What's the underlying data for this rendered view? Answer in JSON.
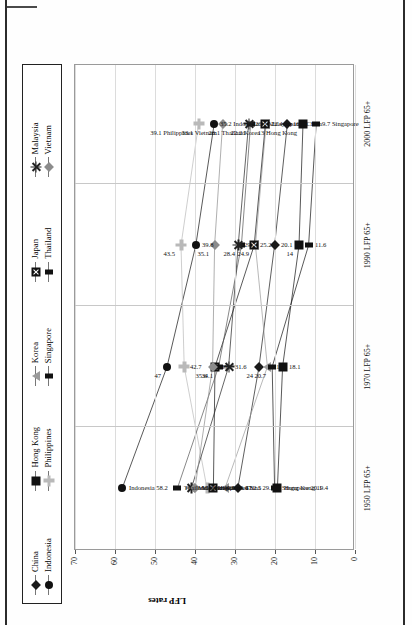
{
  "chart_data": {
    "type": "line",
    "title": "",
    "xlabel": "",
    "ylabel": "LFP rates",
    "ylim": [
      0,
      70
    ],
    "ytick_values": [
      0,
      10,
      20,
      30,
      40,
      50,
      60,
      70
    ],
    "categories": [
      "1950 LFP 65+",
      "1970 LFP 65+",
      "1990 LFP 65+",
      "2000 LFP 65+"
    ],
    "grid": true,
    "legend_position": "top",
    "series": [
      {
        "name": "China",
        "marker": "diamond",
        "color": "#1a1a1a",
        "values": [
          29.3,
          24.0,
          20.1,
          16.9
        ]
      },
      {
        "name": "Indonesia",
        "marker": "circle",
        "color": "#111111",
        "values": [
          58.2,
          47.0,
          39.8,
          35.2
        ]
      },
      {
        "name": "Hong Kong",
        "marker": "square",
        "color": "#111111",
        "values": [
          19.4,
          18.1,
          14.0,
          13.0
        ]
      },
      {
        "name": "Philippines",
        "marker": "plus-gray",
        "color": "#b9b9b9",
        "values": [
          37.0,
          42.7,
          43.5,
          39.1
        ]
      },
      {
        "name": "Korea",
        "marker": "tri",
        "color": "#9a9a9a",
        "values": [
          32.5,
          21.9,
          24.9,
          22.2
        ]
      },
      {
        "name": "Singapore",
        "marker": "square-sm",
        "color": "#111111",
        "values": [
          20.1,
          20.7,
          11.6,
          9.7
        ]
      },
      {
        "name": "Japan",
        "marker": "xbox",
        "color": "#111111",
        "values": [
          35.4,
          35.0,
          25.2,
          22.4
        ]
      },
      {
        "name": "Thailand",
        "marker": "square-sm",
        "color": "#555555",
        "values": [
          44.4,
          34.1,
          28.4,
          26.1
        ]
      },
      {
        "name": "Malaysia",
        "marker": "star",
        "color": "#222222",
        "values": [
          40.9,
          31.6,
          29.2,
          26.6
        ]
      },
      {
        "name": "Vietnam",
        "marker": "diamond-gray",
        "color": "#8c8c8c",
        "values": [
          40.0,
          35.6,
          35.1,
          33.1
        ]
      }
    ],
    "point_labels": {
      "1950 LFP 65+": [
        {
          "series": "Indonesia",
          "text": "Indonesia 58.2"
        },
        {
          "series": "Thailand",
          "text": "Thailand 44.4"
        },
        {
          "series": "Malaysia",
          "text": "Malaysia 40.9"
        },
        {
          "series": "Vietnam",
          "text": "Vietnam 40"
        },
        {
          "series": "Philippines",
          "text": "Philippines 37"
        },
        {
          "series": "Japan",
          "text": "Japan 35.4"
        },
        {
          "series": "Korea",
          "text": "Korea 32.5"
        },
        {
          "series": "China",
          "text": "China 29.3"
        },
        {
          "series": "Singapore",
          "text": "Singapore 20.1"
        },
        {
          "series": "Hong Kong",
          "text": "Hong Kong 19.4"
        }
      ],
      "1970 LFP 65+": [
        {
          "series": "Indonesia",
          "text": "47"
        },
        {
          "series": "Philippines",
          "text": "42.7"
        },
        {
          "series": "Vietnam",
          "text": "35.6"
        },
        {
          "series": "Japan",
          "text": "35"
        },
        {
          "series": "Thailand",
          "text": "34.1"
        },
        {
          "series": "Malaysia",
          "text": "31.6"
        },
        {
          "series": "China",
          "text": "24"
        },
        {
          "series": "Korea",
          "text": "21.9"
        },
        {
          "series": "Singapore",
          "text": "20.7"
        },
        {
          "series": "Hong Kong",
          "text": "18.1"
        }
      ],
      "1990 LFP 65+": [
        {
          "series": "Philippines",
          "text": "43.5"
        },
        {
          "series": "Indonesia",
          "text": "39.8"
        },
        {
          "series": "Vietnam",
          "text": "35.1"
        },
        {
          "series": "Malaysia",
          "text": "29.2"
        },
        {
          "series": "Thailand",
          "text": "28.4"
        },
        {
          "series": "Japan",
          "text": "25.2"
        },
        {
          "series": "Korea",
          "text": "24.9"
        },
        {
          "series": "China",
          "text": "20.1"
        },
        {
          "series": "Hong Kong",
          "text": "14"
        },
        {
          "series": "Singapore",
          "text": "11.6"
        }
      ],
      "2000 LFP 65+": [
        {
          "series": "Philippines",
          "text": "39.1 Philippines"
        },
        {
          "series": "Indonesia",
          "text": "35.2 Indonesia"
        },
        {
          "series": "Vietnam",
          "text": "33.1 Vietnam"
        },
        {
          "series": "Malaysia",
          "text": "26.6 Malaysia"
        },
        {
          "series": "Thailand",
          "text": "26.1 Thailand"
        },
        {
          "series": "Japan",
          "text": "22.4 Japan"
        },
        {
          "series": "Korea",
          "text": "22.2 Korea"
        },
        {
          "series": "China",
          "text": "16.9 China"
        },
        {
          "series": "Hong Kong",
          "text": "13 Hong Kong"
        },
        {
          "series": "Singapore",
          "text": "9.7 Singapore"
        }
      ]
    }
  },
  "legend": {
    "columns": [
      {
        "items": [
          {
            "label": "China",
            "marker": "diamond"
          },
          {
            "label": "Indonesia",
            "marker": "circle"
          }
        ]
      },
      {
        "items": [
          {
            "label": "Hong Kong",
            "marker": "square"
          },
          {
            "label": "Philippines",
            "marker": "plus-gray"
          }
        ]
      },
      {
        "items": [
          {
            "label": "Korea",
            "marker": "tri"
          },
          {
            "label": "Singapore",
            "marker": "square-sm"
          }
        ]
      },
      {
        "items": [
          {
            "label": "Japan",
            "marker": "xbox"
          },
          {
            "label": "Thailand",
            "marker": "square-sm"
          }
        ]
      },
      {
        "items": [
          {
            "label": "Malaysia",
            "marker": "star"
          },
          {
            "label": "Vietnam",
            "marker": "diamond-gray"
          }
        ]
      }
    ]
  }
}
